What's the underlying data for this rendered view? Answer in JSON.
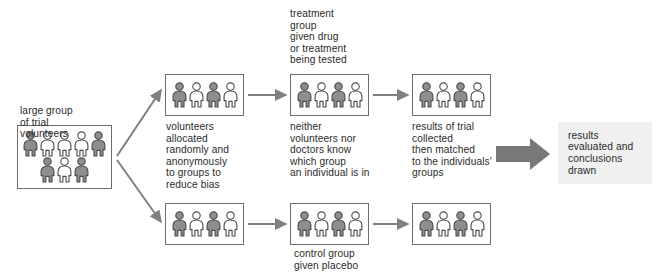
{
  "diagram": {
    "colors": {
      "figure_gray": "#8e8e8e",
      "figure_white": "#ffffff",
      "figure_outline": "#4a4a4a",
      "box_border": "#6d6d6d",
      "arrow": "#808080",
      "block_arrow": "#787878",
      "panel_bg": "#f0f0f0",
      "text": "#2b2b2b",
      "background": "#ffffff"
    },
    "labels": {
      "large_group": "large group\nof trial\nvolunteers",
      "allocation": "volunteers\nallocated\nrandomly and\nanonymously\nto groups to\nreduce bias",
      "treatment_group": "treatment\ngroup\ngiven drug\nor treatment\nbeing tested",
      "blinding": "neither\nvolunteers nor\ndoctors know\nwhich group\nan individual is in",
      "results_collected": "results of trial\ncollected\nthen matched\nto the individuals'\ngroups",
      "control_group": "control group\ngiven placebo",
      "evaluation": "results\nevaluated and\nconclusions\ndrawn"
    },
    "boxes": [
      {
        "id": "large-group-box",
        "name": "large-group-of-volunteers-box",
        "x": 17,
        "y": 125,
        "w": 95,
        "h": 64,
        "rows": [
          [
            "gray",
            "white",
            "white",
            "white",
            "gray"
          ],
          [
            "gray",
            "white",
            "gray"
          ]
        ]
      },
      {
        "id": "allocated-top-box",
        "name": "allocated-treatment-arm-box",
        "x": 165,
        "y": 74,
        "w": 79,
        "h": 42,
        "rows": [
          [
            "gray",
            "white",
            "gray",
            "white"
          ]
        ]
      },
      {
        "id": "allocated-bottom-box",
        "name": "allocated-control-arm-box",
        "x": 165,
        "y": 203,
        "w": 79,
        "h": 42,
        "rows": [
          [
            "gray",
            "white",
            "gray",
            "white"
          ]
        ]
      },
      {
        "id": "treatment-box",
        "name": "treatment-group-box",
        "x": 290,
        "y": 74,
        "w": 79,
        "h": 42,
        "rows": [
          [
            "gray",
            "white",
            "gray",
            "white"
          ]
        ]
      },
      {
        "id": "control-box",
        "name": "control-group-box",
        "x": 290,
        "y": 203,
        "w": 79,
        "h": 42,
        "rows": [
          [
            "gray",
            "white",
            "gray",
            "white"
          ]
        ]
      },
      {
        "id": "results-top-box",
        "name": "treatment-results-box",
        "x": 412,
        "y": 74,
        "w": 79,
        "h": 42,
        "rows": [
          [
            "gray",
            "white",
            "gray",
            "white"
          ]
        ]
      },
      {
        "id": "results-bottom-box",
        "name": "control-results-box",
        "x": 412,
        "y": 203,
        "w": 79,
        "h": 42,
        "rows": [
          [
            "gray",
            "white",
            "gray",
            "white"
          ]
        ]
      }
    ],
    "panel": {
      "x": 558,
      "y": 122,
      "w": 94,
      "h": 62
    },
    "captions": [
      {
        "key": "large_group",
        "name": "caption-large-group",
        "x": 20,
        "y": 105,
        "w": 100
      },
      {
        "key": "allocation",
        "name": "caption-allocation",
        "x": 166,
        "y": 121,
        "w": 100
      },
      {
        "key": "treatment_group",
        "name": "caption-treatment-group",
        "x": 290,
        "y": 8,
        "w": 100
      },
      {
        "key": "blinding",
        "name": "caption-blinding",
        "x": 290,
        "y": 121,
        "w": 110
      },
      {
        "key": "results_collected",
        "name": "caption-results-collected",
        "x": 412,
        "y": 121,
        "w": 110
      },
      {
        "key": "control_group",
        "name": "caption-control-group",
        "x": 294,
        "y": 248,
        "w": 110
      }
    ],
    "arrows": [
      {
        "name": "arrow-split-to-treatment-arm",
        "type": "line",
        "x1": 117,
        "y1": 156,
        "x2": 161,
        "y2": 90
      },
      {
        "name": "arrow-split-to-control-arm",
        "type": "line",
        "x1": 117,
        "y1": 160,
        "x2": 161,
        "y2": 222
      },
      {
        "name": "arrow-allocated-to-treatment",
        "type": "line",
        "x1": 248,
        "y1": 95,
        "x2": 286,
        "y2": 95
      },
      {
        "name": "arrow-treatment-to-results",
        "type": "line",
        "x1": 373,
        "y1": 95,
        "x2": 408,
        "y2": 95
      },
      {
        "name": "arrow-allocated-to-control",
        "type": "line",
        "x1": 248,
        "y1": 224,
        "x2": 286,
        "y2": 224
      },
      {
        "name": "arrow-control-to-results",
        "type": "line",
        "x1": 373,
        "y1": 224,
        "x2": 408,
        "y2": 224
      },
      {
        "name": "arrow-results-to-evaluation",
        "type": "block",
        "x": 496,
        "y": 146,
        "w": 54,
        "h": 16
      }
    ]
  }
}
